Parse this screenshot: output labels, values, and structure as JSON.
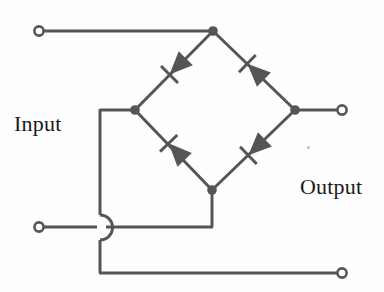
{
  "diagram": {
    "type": "circuit-schematic",
    "canvas": {
      "width": 384,
      "height": 292
    },
    "style": {
      "wire_color": "#555555",
      "wire_width": 3,
      "node_color": "#555555",
      "terminal_fill": "#ffffff",
      "terminal_stroke": "#555555",
      "background": "#fefefe",
      "text_color": "#1a1a1a"
    },
    "labels": {
      "input": "Input",
      "output": "Output"
    },
    "terminals": [
      {
        "name": "input-top-terminal",
        "x": 39,
        "y": 31,
        "r": 5
      },
      {
        "name": "input-bottom-terminal",
        "x": 39,
        "y": 227,
        "r": 5
      },
      {
        "name": "output-top-terminal",
        "x": 342,
        "y": 110,
        "r": 5
      },
      {
        "name": "output-bottom-terminal",
        "x": 342,
        "y": 273,
        "r": 5
      }
    ],
    "nodes": [
      {
        "name": "bridge-top-node",
        "x": 213,
        "y": 31,
        "r": 4.5
      },
      {
        "name": "bridge-left-node",
        "x": 135,
        "y": 110,
        "r": 4.5
      },
      {
        "name": "bridge-right-node",
        "x": 295,
        "y": 110,
        "r": 4.5
      },
      {
        "name": "bridge-bottom-node",
        "x": 212,
        "y": 190,
        "r": 4.5
      }
    ],
    "wires": [
      {
        "name": "wire-input-top",
        "points": "44,31 213,31"
      },
      {
        "name": "wire-output-top",
        "points": "295,110 337,110"
      },
      {
        "name": "wire-input-bottom-left",
        "points": "44,227 96,227"
      },
      {
        "name": "wire-left-node-stub",
        "points": "135,110 100,110"
      },
      {
        "name": "wire-left-vertical-upper",
        "points": "100,110 100,215"
      },
      {
        "name": "wire-left-vertical-lower",
        "points": "100,240 100,273"
      },
      {
        "name": "wire-bottom-return",
        "points": "100,273 337,273"
      },
      {
        "name": "wire-bottom-node-down",
        "points": "212,190 212,227"
      },
      {
        "name": "wire-bottom-to-hop",
        "points": "212,227 104,227"
      }
    ],
    "wire_hop": {
      "name": "wire-crossing-hop",
      "path": "M 100,215 A 13,13 0 0 1 100,240",
      "description": "semicircular jumper showing non-connected crossing"
    },
    "diode_branches": [
      {
        "name": "diode-top-left",
        "from": {
          "x": 213,
          "y": 31
        },
        "to": {
          "x": 135,
          "y": 110
        },
        "direction": "down-left",
        "arrow_center": {
          "x": 178,
          "y": 66
        },
        "bar_center": {
          "x": 167,
          "y": 78
        }
      },
      {
        "name": "diode-top-right",
        "from": {
          "x": 213,
          "y": 31
        },
        "to": {
          "x": 295,
          "y": 110
        },
        "direction": "up-left",
        "arrow_center": {
          "x": 256,
          "y": 73
        },
        "bar_center": {
          "x": 245,
          "y": 62
        }
      },
      {
        "name": "diode-bottom-left",
        "from": {
          "x": 135,
          "y": 110
        },
        "to": {
          "x": 212,
          "y": 190
        },
        "direction": "up-left",
        "arrow_center": {
          "x": 177,
          "y": 152
        },
        "bar_center": {
          "x": 165,
          "y": 140
        }
      },
      {
        "name": "diode-bottom-right",
        "from": {
          "x": 295,
          "y": 110
        },
        "to": {
          "x": 212,
          "y": 190
        },
        "direction": "down-left",
        "arrow_center": {
          "x": 257,
          "y": 147
        },
        "bar_center": {
          "x": 245,
          "y": 158
        }
      }
    ]
  }
}
